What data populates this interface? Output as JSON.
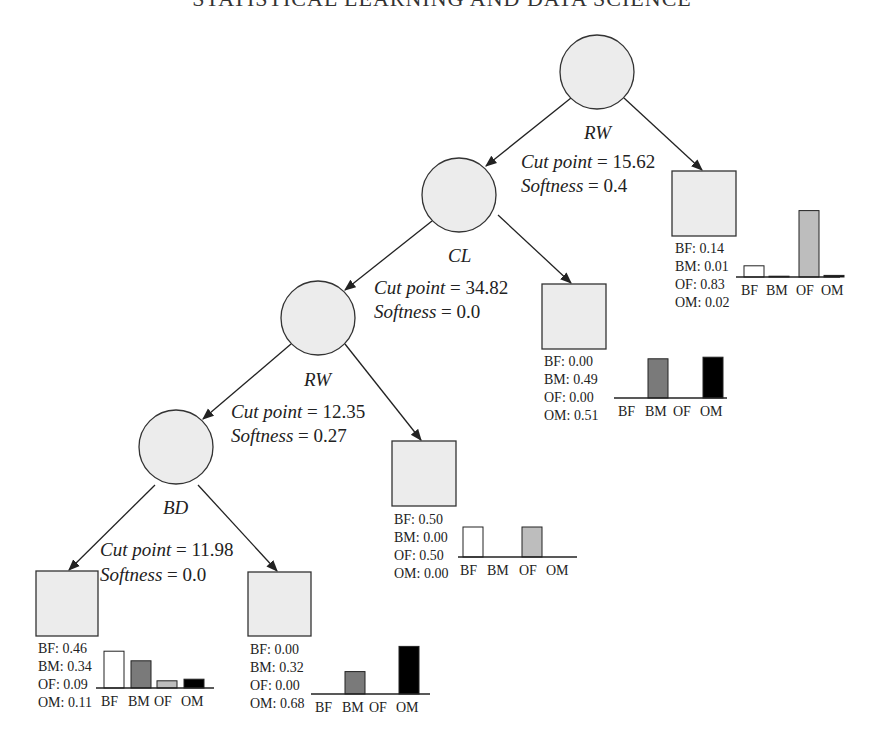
{
  "running_title": "STATISTICAL LEARNING AND DATA SCIENCE",
  "class_colors": {
    "BF": "#ffffff",
    "BM": "#7a7a7a",
    "OF": "#bdbdbd",
    "OM": "#000000"
  },
  "categories": [
    "BF",
    "BM",
    "OF",
    "OM"
  ],
  "internal_nodes": [
    {
      "id": "root",
      "variable": "RW",
      "cut_point_label": "Cut point",
      "cut_point": "= 15.62",
      "softness_label": "Softness",
      "softness": "= 0.4"
    },
    {
      "id": "n2",
      "variable": "CL",
      "cut_point_label": "Cut point",
      "cut_point": "= 34.82",
      "softness_label": "Softness",
      "softness": "= 0.0"
    },
    {
      "id": "n3",
      "variable": "RW",
      "cut_point_label": "Cut point",
      "cut_point": "= 12.35",
      "softness_label": "Softness",
      "softness": "= 0.27"
    },
    {
      "id": "n4",
      "variable": "BD",
      "cut_point_label": "Cut point",
      "cut_point": "= 11.98",
      "softness_label": "Softness",
      "softness": "= 0.0"
    }
  ],
  "leaves": [
    {
      "id": "leaf1",
      "parent": "root",
      "probs": {
        "BF": "0.14",
        "BM": "0.01",
        "OF": "0.83",
        "OM": "0.02"
      },
      "values": [
        0.14,
        0.01,
        0.83,
        0.02
      ],
      "lines": [
        "BF: 0.14",
        "BM: 0.01",
        "OF: 0.83",
        "OM: 0.02"
      ]
    },
    {
      "id": "leaf2",
      "parent": "n2",
      "probs": {
        "BF": "0.00",
        "BM": "0.49",
        "OF": "0.00",
        "OM": "0.51"
      },
      "values": [
        0.0,
        0.49,
        0.0,
        0.51
      ],
      "lines": [
        "BF: 0.00",
        "BM: 0.49",
        "OF: 0.00",
        "OM: 0.51"
      ]
    },
    {
      "id": "leaf3",
      "parent": "n3",
      "probs": {
        "BF": "0.50",
        "BM": "0.00",
        "OF": "0.50",
        "OM": "0.00"
      },
      "values": [
        0.5,
        0.0,
        0.5,
        0.0
      ],
      "lines": [
        "BF: 0.50",
        "BM: 0.00",
        "OF: 0.50",
        "OM: 0.00"
      ]
    },
    {
      "id": "leaf4",
      "parent": "n4",
      "side": "left",
      "probs": {
        "BF": "0.46",
        "BM": "0.34",
        "OF": "0.09",
        "OM": "0.11"
      },
      "values": [
        0.46,
        0.34,
        0.09,
        0.11
      ],
      "lines": [
        "BF: 0.46",
        "BM: 0.34",
        "OF: 0.09",
        "OM: 0.11"
      ]
    },
    {
      "id": "leaf5",
      "parent": "n4",
      "side": "right",
      "probs": {
        "BF": "0.00",
        "BM": "0.32",
        "OF": "0.00",
        "OM": "0.68"
      },
      "values": [
        0.0,
        0.32,
        0.0,
        0.68
      ],
      "lines": [
        "BF: 0.00",
        "BM: 0.32",
        "OF: 0.00",
        "OM: 0.68"
      ]
    }
  ]
}
